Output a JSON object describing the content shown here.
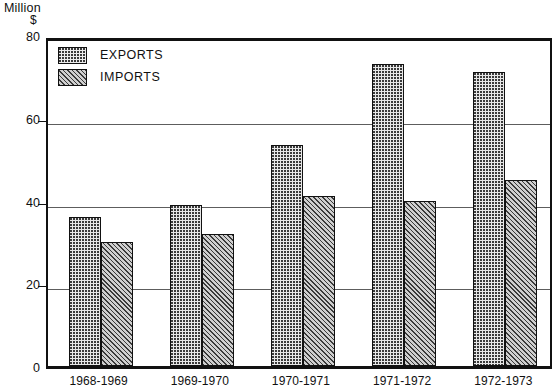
{
  "chart_data": {
    "type": "bar",
    "title": "",
    "xlabel": "",
    "ylabel": "Million $",
    "ylabel_lines": [
      "Million",
      "$"
    ],
    "ylim": [
      0,
      80
    ],
    "yticks": [
      0,
      20,
      40,
      60,
      80
    ],
    "ytick_labels": [
      "0",
      "20",
      "40",
      "60",
      "80"
    ],
    "grid": true,
    "grid_axis": "y",
    "legend_position": "top-left",
    "categories": [
      "1968-1969",
      "1969-1970",
      "1970-1971",
      "1971-1972",
      "1972-1973"
    ],
    "series": [
      {
        "name": "EXPORTS",
        "values": [
          36,
          39,
          53.5,
          73,
          71
        ]
      },
      {
        "name": "IMPORTS",
        "values": [
          30,
          32,
          41,
          40,
          45
        ]
      }
    ]
  },
  "legend": {
    "items": [
      {
        "label": "EXPORTS",
        "pattern": "dotted"
      },
      {
        "label": "IMPORTS",
        "pattern": "hatched"
      }
    ]
  },
  "colors": {
    "axis": "#111111",
    "gridline": "#5d5d5d",
    "exports_fill": "#e8e8e8",
    "imports_fill": "#cfcfcf",
    "background": "#ffffff"
  }
}
